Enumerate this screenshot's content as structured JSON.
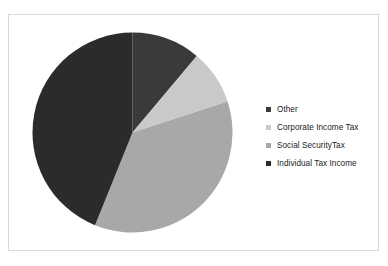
{
  "chart_data": {
    "type": "pie",
    "title": "",
    "categories": [
      "Other",
      "Corporate Income Tax",
      "Social SecurityTax",
      "Individual Tax Income"
    ],
    "values": [
      11.1,
      8.9,
      36.1,
      43.9
    ],
    "units": "percent",
    "start_angle_deg": 0,
    "direction": "clockwise",
    "slice_angles_deg": [
      40,
      32,
      130,
      158
    ],
    "colors": [
      "#3a3a3a",
      "#c9c9c9",
      "#a8a8a8",
      "#2b2b2b"
    ],
    "legend": {
      "position": "right",
      "entries": [
        {
          "label": "Other",
          "color": "#3a3a3a",
          "value": 11.1
        },
        {
          "label": "Corporate Income Tax",
          "color": "#c9c9c9",
          "value": 8.9
        },
        {
          "label": "Social SecurityTax",
          "color": "#a8a8a8",
          "value": 36.1
        },
        {
          "label": "Individual Tax Income",
          "color": "#2b2b2b",
          "value": 43.9
        }
      ]
    },
    "grid": false,
    "xlabel": "",
    "ylabel": "",
    "data_labels_shown": false
  },
  "geometry": {
    "center_x": 100.5,
    "center_y": 100.5,
    "radius": 100
  },
  "frame": {
    "border_color": "#d9d9d9",
    "background": "#ffffff"
  }
}
